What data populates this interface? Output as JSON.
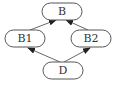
{
  "diagram": {
    "type": "directed-graph",
    "nodes": [
      {
        "id": "B",
        "label": "B"
      },
      {
        "id": "B1",
        "label": "B1"
      },
      {
        "id": "B2",
        "label": "B2"
      },
      {
        "id": "D",
        "label": "D"
      }
    ],
    "edges": [
      {
        "from": "B1",
        "to": "B"
      },
      {
        "from": "B2",
        "to": "B"
      },
      {
        "from": "D",
        "to": "B1"
      },
      {
        "from": "D",
        "to": "B2"
      }
    ]
  },
  "colors": {
    "stroke": "#555555",
    "arrow": "#222222",
    "text": "#333333",
    "background": "#ffffff"
  }
}
